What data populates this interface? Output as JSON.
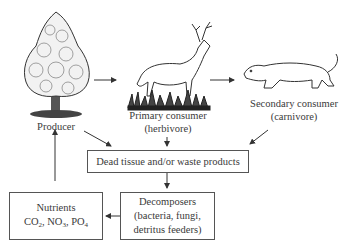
{
  "diagram": {
    "type": "nutrient-cycle-food-chain",
    "nodes": {
      "producer": {
        "label": "Producer",
        "icon": "tree-icon"
      },
      "primary": {
        "label": "Primary consumer",
        "sub": "(herbivore)",
        "icon": "deer-icon"
      },
      "secondary": {
        "label": "Secondary consumer",
        "sub": "(carnivore)",
        "icon": "cougar-icon"
      },
      "dead": {
        "label": "Dead tissue and/or waste products"
      },
      "decomposers": {
        "line1": "Decomposers",
        "line2": "(bacteria, fungi,",
        "line3": "detritus feeders)"
      },
      "nutrients": {
        "line1": "Nutrients",
        "co2": "CO",
        "co2_sub": "2",
        "no3": "NO",
        "no3_sub": "3",
        "po4": "PO",
        "po4_sub": "4"
      }
    },
    "edges": [
      [
        "Producer",
        "Primary consumer"
      ],
      [
        "Primary consumer",
        "Secondary consumer"
      ],
      [
        "Producer",
        "Dead tissue and/or waste products"
      ],
      [
        "Primary consumer",
        "Dead tissue and/or waste products"
      ],
      [
        "Secondary consumer",
        "Dead tissue and/or waste products"
      ],
      [
        "Dead tissue and/or waste products",
        "Decomposers"
      ],
      [
        "Decomposers",
        "Nutrients"
      ],
      [
        "Nutrients",
        "Producer"
      ]
    ]
  }
}
